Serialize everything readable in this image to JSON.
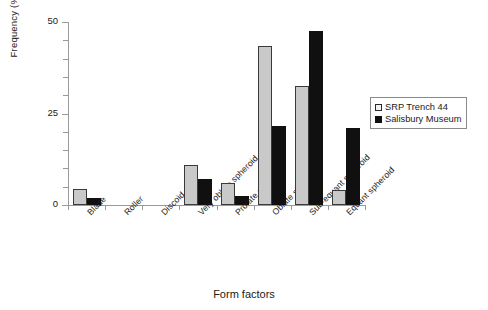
{
  "chart_data": {
    "type": "bar",
    "title": "",
    "xlabel": "Form factors",
    "ylabel": "Frequency (%)",
    "ylim": [
      0,
      50
    ],
    "yticks": [
      0,
      25,
      50
    ],
    "ytick_labels": [
      "0",
      "25",
      "50"
    ],
    "minor_ticks": true,
    "grid": false,
    "legend_position": "right",
    "categories": [
      "Blade",
      "Roller",
      "Discoid",
      "Very oblate spheroid",
      "Prolate spheroid",
      "Oblate spheroid",
      "Sub-equant spheroid",
      "Equant spheroid"
    ],
    "series": [
      {
        "name": "SRP Trench 44",
        "color": "#c9c9c9",
        "values": [
          4.5,
          0,
          0,
          11,
          6,
          43.5,
          32.5,
          4
        ]
      },
      {
        "name": "Salisbury Museum",
        "color": "#101010",
        "values": [
          2,
          0,
          0,
          7,
          2.5,
          21.5,
          47.5,
          21
        ]
      }
    ]
  },
  "legend": {
    "items": [
      {
        "label": "SRP Trench 44"
      },
      {
        "label": "Salisbury Museum"
      }
    ]
  }
}
